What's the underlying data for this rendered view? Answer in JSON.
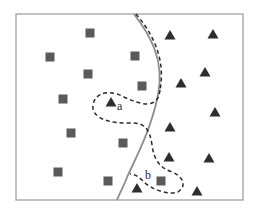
{
  "diagram": {
    "colors": {
      "background": "#ffffff",
      "frame": "#9a9a9a",
      "square_fill": "#5a5a5a",
      "triangle_fill": "#2e2e2e",
      "solid_boundary": "#8c8c8c",
      "dashed_boundary": "#2a2a2a"
    },
    "frame": {
      "x": 16,
      "y": 14,
      "width": 227,
      "height": 186
    },
    "labels": [
      {
        "id": "a",
        "text": "a",
        "x": 117,
        "y": 110
      },
      {
        "id": "b",
        "text": "b",
        "x": 145,
        "y": 179
      }
    ],
    "squares": [
      {
        "x": 90,
        "y": 33
      },
      {
        "x": 50,
        "y": 57
      },
      {
        "x": 88,
        "y": 74
      },
      {
        "x": 135,
        "y": 56
      },
      {
        "x": 142,
        "y": 86
      },
      {
        "x": 63,
        "y": 99
      },
      {
        "x": 71,
        "y": 133
      },
      {
        "x": 123,
        "y": 143
      },
      {
        "x": 58,
        "y": 172
      },
      {
        "x": 108,
        "y": 181
      },
      {
        "x": 161,
        "y": 181
      }
    ],
    "triangles": [
      {
        "x": 170,
        "y": 35
      },
      {
        "x": 213,
        "y": 34
      },
      {
        "x": 205,
        "y": 72
      },
      {
        "x": 181,
        "y": 83
      },
      {
        "x": 215,
        "y": 112
      },
      {
        "x": 170,
        "y": 127
      },
      {
        "x": 169,
        "y": 157
      },
      {
        "x": 209,
        "y": 158
      },
      {
        "x": 197,
        "y": 191
      },
      {
        "x": 111,
        "y": 102
      },
      {
        "x": 137,
        "y": 188
      }
    ]
  }
}
